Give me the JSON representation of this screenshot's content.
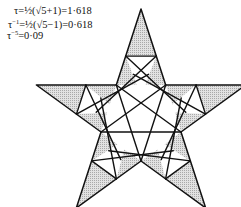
{
  "formulas": {
    "line1": {
      "lhs": "τ",
      "rhs": "=½(√5+1)=1·618"
    },
    "line2": {
      "lhs": "τ",
      "exp": "−1",
      "rhs": "=½(√5−1)=0·618"
    },
    "line3": {
      "lhs": "τ",
      "exp": "−5",
      "rhs": "=0·09"
    }
  },
  "figure": {
    "shape": "pentagram",
    "colors": {
      "stroke": "#111111",
      "shade": "#c8c8c8",
      "background": "#ffffff"
    }
  }
}
